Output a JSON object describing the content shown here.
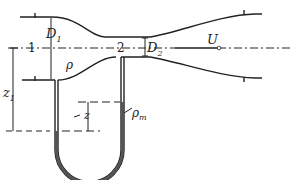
{
  "diagram": {
    "labels": {
      "D1": "D",
      "D1_sub": "1",
      "D2": "D",
      "D2_sub": "2",
      "section1": "1",
      "section2": "2",
      "U": "U",
      "rho": "ρ",
      "rho_m": "ρ",
      "rho_m_sub": "m",
      "z": "z",
      "z1": "z",
      "z1_sub": "1"
    },
    "colors": {
      "line": "#222222",
      "fluid": "#555555",
      "background": "#ffffff"
    }
  }
}
